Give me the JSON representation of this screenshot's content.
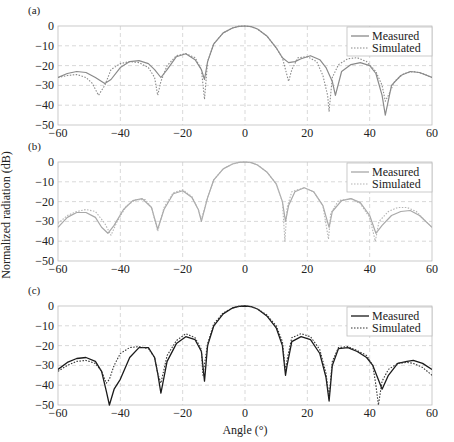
{
  "figure": {
    "ylabel": "Normalized radiation (dB)",
    "xlabel": "Angle (°)"
  },
  "chart_data": [
    {
      "type": "line",
      "panel_label": "(a)",
      "xlabel": "",
      "ylabel": "Normalized radiation (dB)",
      "xlim": [
        -60,
        60
      ],
      "ylim": [
        -50,
        0
      ],
      "xticks": [
        -60,
        -40,
        -20,
        0,
        20,
        40,
        60
      ],
      "yticks": [
        0,
        -10,
        -20,
        -30,
        -40,
        -50
      ],
      "grid": true,
      "legend": {
        "position": "upper right",
        "entries": [
          "Measured",
          "Simulated"
        ]
      },
      "colors": {
        "measured": "#8a8a8a",
        "simulated": "#8a8a8a"
      },
      "series": [
        {
          "name": "Measured",
          "style": "solid",
          "x": [
            -60,
            -57,
            -54,
            -51,
            -48,
            -45,
            -43,
            -40,
            -37,
            -34,
            -31,
            -29,
            -27,
            -25,
            -22,
            -19,
            -16,
            -14,
            -13,
            -12,
            -10,
            -7,
            -4,
            -2,
            0,
            2,
            4,
            7,
            10,
            12,
            14,
            16,
            18,
            21,
            24,
            26,
            28,
            29,
            31,
            34,
            37,
            40,
            42,
            44,
            45,
            47,
            50,
            53,
            56,
            60
          ],
          "y": [
            -26,
            -24,
            -23,
            -23.5,
            -26,
            -29,
            -27,
            -21,
            -18,
            -17.5,
            -19,
            -22,
            -26,
            -22,
            -15.5,
            -14,
            -17,
            -22,
            -27,
            -18,
            -9,
            -3.5,
            -1,
            -0.2,
            0,
            -0.3,
            -1.5,
            -5,
            -11,
            -16,
            -18.5,
            -18,
            -16.5,
            -15,
            -17,
            -21,
            -28,
            -35,
            -23,
            -19.5,
            -18.5,
            -20,
            -24,
            -35,
            -45,
            -30,
            -25,
            -23,
            -23.5,
            -26
          ]
        },
        {
          "name": "Simulated",
          "style": "dotted",
          "x": [
            -60,
            -57,
            -54,
            -51,
            -49,
            -47,
            -45,
            -43,
            -40,
            -37,
            -34,
            -31,
            -29,
            -28,
            -27,
            -25,
            -22,
            -19,
            -16,
            -14,
            -13,
            -12,
            -10,
            -7,
            -4,
            -2,
            0,
            2,
            4,
            7,
            10,
            12,
            13,
            14,
            15,
            17,
            20,
            23,
            25,
            26.5,
            27,
            28,
            30,
            33,
            36,
            39,
            42,
            44,
            45,
            46,
            48,
            51,
            54,
            57,
            60
          ],
          "y": [
            -26,
            -25,
            -24.5,
            -26,
            -29,
            -35,
            -30,
            -22,
            -19,
            -18,
            -18.5,
            -21,
            -26,
            -35,
            -28,
            -20,
            -15,
            -14,
            -16,
            -22,
            -37,
            -18,
            -9,
            -3.5,
            -1,
            -0.2,
            0,
            -0.3,
            -1.5,
            -5,
            -11,
            -16,
            -22,
            -28,
            -22,
            -16,
            -15.5,
            -18,
            -25,
            -35,
            -43,
            -26,
            -19.5,
            -16.5,
            -16,
            -18,
            -23,
            -30,
            -38,
            -35,
            -28,
            -24,
            -23,
            -24,
            -26
          ]
        }
      ]
    },
    {
      "type": "line",
      "panel_label": "(b)",
      "xlabel": "",
      "ylabel": "Normalized radiation (dB)",
      "xlim": [
        -60,
        60
      ],
      "ylim": [
        -50,
        0
      ],
      "xticks": [
        -60,
        -40,
        -20,
        0,
        20,
        40,
        60
      ],
      "yticks": [
        0,
        -10,
        -20,
        -30,
        -40,
        -50
      ],
      "grid": true,
      "legend": {
        "position": "upper right",
        "entries": [
          "Measured",
          "Simulated"
        ]
      },
      "colors": {
        "measured": "#a8a8a8",
        "simulated": "#b4b4b4"
      },
      "series": [
        {
          "name": "Measured",
          "style": "solid",
          "x": [
            -60,
            -57,
            -54,
            -51,
            -48,
            -46,
            -44,
            -42,
            -39,
            -36,
            -33,
            -30,
            -28,
            -26,
            -23,
            -20,
            -17,
            -15,
            -14,
            -12,
            -10,
            -7,
            -4,
            -2,
            0,
            2,
            4,
            7,
            10,
            12,
            13,
            14,
            16,
            19,
            22,
            25,
            27,
            28,
            31,
            34,
            37,
            40,
            42,
            44,
            47,
            50,
            53,
            56,
            60
          ],
          "y": [
            -33,
            -28,
            -25.5,
            -25.5,
            -28,
            -33,
            -36,
            -32,
            -24,
            -19.5,
            -18.5,
            -23,
            -34,
            -24,
            -16,
            -14.5,
            -18,
            -24,
            -30,
            -18,
            -9,
            -3.5,
            -1,
            -0.2,
            0,
            -0.3,
            -1.5,
            -5,
            -11,
            -20,
            -30,
            -22,
            -15,
            -13,
            -15,
            -22,
            -33,
            -25,
            -19.5,
            -18.5,
            -20.5,
            -27,
            -36,
            -32,
            -27,
            -25,
            -24.5,
            -27,
            -33
          ]
        },
        {
          "name": "Simulated",
          "style": "dotted",
          "x": [
            -60,
            -57,
            -54,
            -51,
            -48,
            -45,
            -43,
            -41,
            -38,
            -35,
            -32,
            -30,
            -28,
            -26,
            -23,
            -20,
            -17,
            -15,
            -14,
            -12,
            -10,
            -7,
            -4,
            -2,
            0,
            2,
            4,
            7,
            10,
            12,
            12.8,
            13.5,
            15,
            19,
            22,
            25,
            26.8,
            27.5,
            30,
            34,
            37,
            40,
            41.8,
            43,
            46,
            49,
            52,
            55,
            58,
            60
          ],
          "y": [
            -31,
            -27,
            -25,
            -24,
            -25,
            -31,
            -37,
            -30,
            -22,
            -19,
            -19,
            -23,
            -35,
            -23,
            -15.5,
            -14,
            -17.5,
            -24,
            -29,
            -18,
            -9,
            -3.5,
            -1,
            -0.2,
            0,
            -0.3,
            -1.5,
            -5,
            -11,
            -20,
            -40,
            -23,
            -15,
            -13,
            -15,
            -22,
            -39,
            -26,
            -19.5,
            -18.5,
            -21,
            -28,
            -40,
            -30,
            -25,
            -23,
            -23,
            -25,
            -30,
            -33
          ]
        }
      ]
    },
    {
      "type": "line",
      "panel_label": "(c)",
      "xlabel": "Angle (°)",
      "ylabel": "Normalized radiation (dB)",
      "xlim": [
        -60,
        60
      ],
      "ylim": [
        -50,
        0
      ],
      "xticks": [
        -60,
        -40,
        -20,
        0,
        20,
        40,
        60
      ],
      "yticks": [
        0,
        -10,
        -20,
        -30,
        -40,
        -50
      ],
      "grid": true,
      "legend": {
        "position": "upper right",
        "entries": [
          "Measured",
          "Simulated"
        ]
      },
      "colors": {
        "measured": "#1a1a1a",
        "simulated": "#333333"
      },
      "series": [
        {
          "name": "Measured",
          "style": "solid",
          "x": [
            -60,
            -57,
            -54,
            -51,
            -48,
            -46,
            -44.5,
            -43.5,
            -42,
            -40,
            -37,
            -34,
            -31,
            -29,
            -28,
            -27,
            -25,
            -22,
            -19,
            -16,
            -14,
            -13,
            -12,
            -10,
            -7,
            -4,
            -2,
            0,
            2,
            4,
            7,
            10,
            12,
            13,
            13.5,
            15,
            18,
            21,
            24,
            26,
            27,
            28,
            30,
            33,
            36,
            39,
            41,
            43,
            44,
            46,
            49,
            52,
            54,
            57,
            60
          ],
          "y": [
            -32,
            -28.5,
            -26.5,
            -26,
            -28,
            -33,
            -43,
            -50,
            -42,
            -37,
            -26,
            -21,
            -21,
            -26,
            -34,
            -44,
            -28,
            -19,
            -15.5,
            -17,
            -23,
            -38,
            -20,
            -10,
            -4,
            -1,
            -0.2,
            0,
            -0.3,
            -1.5,
            -5,
            -11,
            -20,
            -35,
            -30,
            -18,
            -15.5,
            -17,
            -24,
            -36,
            -48,
            -30,
            -21.5,
            -21,
            -23,
            -26,
            -30,
            -38,
            -42,
            -35,
            -29,
            -28,
            -27.5,
            -29,
            -32
          ]
        },
        {
          "name": "Simulated",
          "style": "dotted",
          "x": [
            -60,
            -57,
            -54,
            -51,
            -48,
            -46,
            -44.5,
            -43.5,
            -42,
            -40,
            -37,
            -34,
            -31,
            -29,
            -28,
            -27,
            -25,
            -22,
            -19,
            -16,
            -14,
            -13.5,
            -12,
            -10,
            -7,
            -4,
            -2,
            0,
            2,
            4,
            7,
            10,
            12,
            13,
            13.5,
            15,
            18,
            21,
            24,
            26,
            27,
            28,
            30,
            33,
            36,
            39,
            41,
            42,
            42.8,
            44,
            46,
            49,
            52,
            54,
            57,
            60
          ],
          "y": [
            -33,
            -30,
            -28,
            -27.5,
            -29,
            -33,
            -39,
            -37,
            -30,
            -24,
            -21,
            -20.5,
            -21.5,
            -26,
            -34,
            -39,
            -25,
            -17.5,
            -14,
            -16,
            -22,
            -35,
            -19,
            -9,
            -3.5,
            -1,
            -0.2,
            0,
            -0.3,
            -1.5,
            -4.5,
            -10,
            -18,
            -33,
            -27,
            -16,
            -14,
            -15.5,
            -22,
            -34,
            -46,
            -28,
            -21,
            -20.5,
            -22.5,
            -25,
            -30,
            -40,
            -50,
            -38,
            -32,
            -29,
            -28.5,
            -29,
            -31,
            -35
          ]
        }
      ]
    }
  ]
}
